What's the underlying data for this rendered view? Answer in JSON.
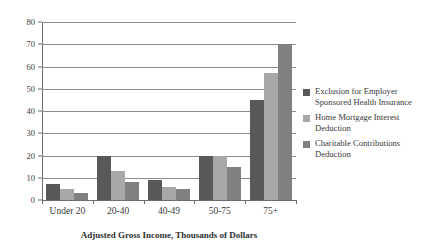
{
  "chart_data": {
    "type": "bar",
    "title": "",
    "subtitle": "",
    "xlabel": "Adjusted Gross Income, Thousands of Dollars",
    "ylabel": "",
    "categories": [
      "Under 20",
      "20-40",
      "40-49",
      "50-75",
      "75+"
    ],
    "series": [
      {
        "name": "Exclusion for Employer Sponsored Health Insurance",
        "name_line1": "Exclusion for Employer",
        "name_line2": "Sponsored Health Insurance",
        "color": "#595959",
        "values": [
          7,
          20,
          9,
          20,
          45
        ]
      },
      {
        "name": "Home Mortgage Interest Deduction",
        "name_line1": "Home Mortgage Interest",
        "name_line2": "Deduction",
        "color": "#a8a8a8",
        "values": [
          5,
          13,
          6,
          20,
          57
        ]
      },
      {
        "name": "Charitable Contributions Deduction",
        "name_line1": "Charitable Contributions",
        "name_line2": "Deduction",
        "color": "#808080",
        "values": [
          3,
          8,
          5,
          15,
          70
        ]
      }
    ],
    "ylim": [
      0,
      80
    ],
    "ytick_step": 10,
    "yticks": [
      0,
      10,
      20,
      30,
      40,
      50,
      60,
      70,
      80
    ],
    "ytick_labels": [
      "0",
      "10",
      "20",
      "30",
      "40",
      "50",
      "60",
      "70",
      "80"
    ],
    "grid": true,
    "grid_axis": "y",
    "legend_position": "right",
    "axis_color": "#6d6d6d",
    "grid_color": "#8d8d8d",
    "text_color": "#3a3a3a",
    "background": "#ffffff"
  }
}
